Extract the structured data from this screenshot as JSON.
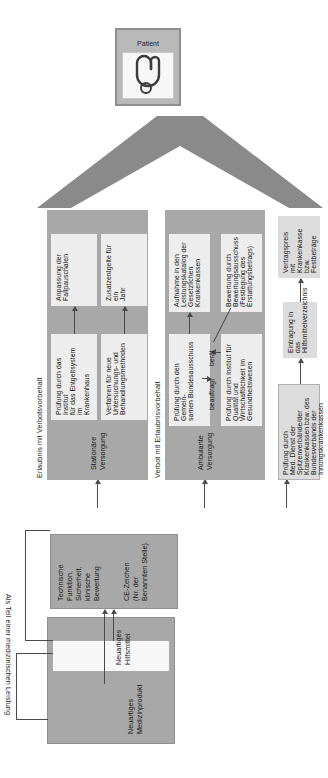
{
  "diagram": {
    "orientation_note": "rotated",
    "colors": {
      "dark": "#a8a8a8",
      "mid": "#b9b9b9",
      "light": "#dcdcdc",
      "pale": "#ededed",
      "white": "#f7f7f7",
      "line": "#4a4a4a"
    }
  },
  "patient": {
    "label": "Patient",
    "icon": "person-icon"
  },
  "sections": {
    "erlaubnis": "Erlaubnis mit Verbotsvorbehalt",
    "verbot": "Verbot mit Erlaubnisvorbehalt",
    "als_teil": "Als Teil einer medizinischen Leistung"
  },
  "columns": {
    "stationaer": "Stationäre\nVersorgung",
    "ambulant": "Ambulante\nVersorgung"
  },
  "nodes": {
    "pruefung_entgeltsystem": "Prüfung durch das Institut\nfür das Entgeltsystem im\nKrankenhaus",
    "anpassung_fallpauschalen": "Anpassung der\nFallpauschalen",
    "verfahren_neue_methoden": "Verfahren für neue\nUntersuchungs- und\nBehandlungsmethoden",
    "zusatzentgelte": "Zusatzentgelte für ein\nJahr",
    "pruefung_gba": "Prüfung durch den Gemein-\nsamen Bundesausschuss",
    "aufnahme_leistungskatalog": "Aufnahme in den\nLeistungskatalog der\nGesetzlichen Krankenkassen",
    "pruefung_iqwig": "Prüfung durch Institut für\nQualität und\nWirtschaftlichkeit im\nGesundheitswesen",
    "bewertung_bewertungsausschuss": "Bewertung durch\nBewertungsausschuss\n(Festlegung des\nErstattungsbetrags)",
    "pruefung_mdk": "Prüfung durch\nMed. Dienst der\nSpitzenverbände/der\nKrankenkassen bzw. des\nBundesverbands der\nInnungskrankenkassen",
    "eintragung_hilfsmittelverzeichnis": "Eintragung in das\nHilfsmittelverzeichnis",
    "vertragspreis": "Vertragspreis mit\nKrankenkasse bzw.\nFestbeträge",
    "neuartiges_medizinprodukt": "Neuartiges\nMedizinprodukt",
    "neuartiges_hilfsmittel": "Neuartiges Hilfsmittel",
    "ce_zeichen": "CE-Zeichen\n(Nr. der Benannten Stelle)",
    "technische_funktion": "Technische Funktion,\nSicherheit, klinische Bewertung"
  },
  "edges": {
    "beauftragt": "beauftragt",
    "beraet": "berät"
  }
}
